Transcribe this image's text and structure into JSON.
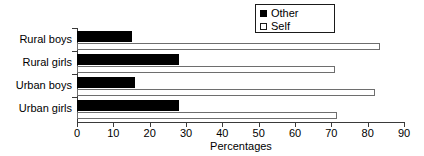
{
  "chart_data": {
    "type": "bar",
    "orientation": "horizontal",
    "title": "",
    "xlabel": "Percentages",
    "ylabel": "",
    "xlim": [
      0,
      90
    ],
    "xticks": [
      0,
      10,
      20,
      30,
      40,
      50,
      60,
      70,
      80,
      90
    ],
    "grid": false,
    "legend_position": "top-right",
    "categories": [
      "Rural boys",
      "Rural girls",
      "Urban boys",
      "Urban girls"
    ],
    "series": [
      {
        "name": "Other",
        "color": "#000000",
        "style": "filled",
        "values": [
          15,
          28,
          16,
          28
        ]
      },
      {
        "name": "Self",
        "color": "#ffffff",
        "style": "outline",
        "values": [
          83.5,
          71,
          82,
          71.5
        ]
      }
    ]
  },
  "legend": {
    "items": [
      {
        "label": "Other",
        "swatch": "filled-square-icon"
      },
      {
        "label": "Self",
        "swatch": "empty-square-icon"
      }
    ]
  },
  "axis": {
    "x_title": "Percentages",
    "x_tick_labels": [
      "0",
      "10",
      "20",
      "30",
      "40",
      "50",
      "60",
      "70",
      "80",
      "90"
    ],
    "y_tick_labels": [
      "Rural boys",
      "Rural girls",
      "Urban boys",
      "Urban girls"
    ]
  },
  "colors": {
    "other_series": "#000000",
    "self_series": "#ffffff",
    "self_border": "#6e6e6e",
    "axis": "#3a3a3a",
    "text": "#000000",
    "background": "#ffffff"
  }
}
